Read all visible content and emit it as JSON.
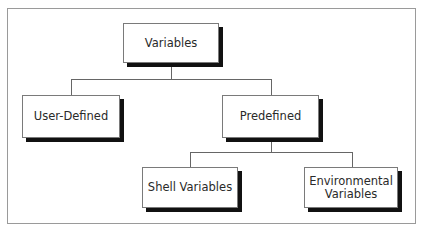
{
  "diagram": {
    "type": "hierarchy-tree",
    "root": {
      "id": "variables",
      "label": "Variables"
    },
    "nodes": [
      {
        "id": "variables",
        "label": "Variables",
        "parent": null
      },
      {
        "id": "user-defined",
        "label": "User-Defined",
        "parent": "variables"
      },
      {
        "id": "predefined",
        "label": "Predefined",
        "parent": "variables"
      },
      {
        "id": "shell-variables",
        "label": "Shell Variables",
        "parent": "predefined"
      },
      {
        "id": "environmental-variables",
        "label": "Environmental Variables",
        "label_lines": [
          "Environmental",
          "Variables"
        ],
        "parent": "predefined"
      }
    ],
    "edges": [
      {
        "from": "variables",
        "to": "user-defined"
      },
      {
        "from": "variables",
        "to": "predefined"
      },
      {
        "from": "predefined",
        "to": "shell-variables"
      },
      {
        "from": "predefined",
        "to": "environmental-variables"
      }
    ]
  },
  "labels": {
    "variables": "Variables",
    "user_defined": "User-Defined",
    "predefined": "Predefined",
    "shell_variables": "Shell Variables",
    "env_line1": "Environmental",
    "env_line2": "Variables"
  }
}
